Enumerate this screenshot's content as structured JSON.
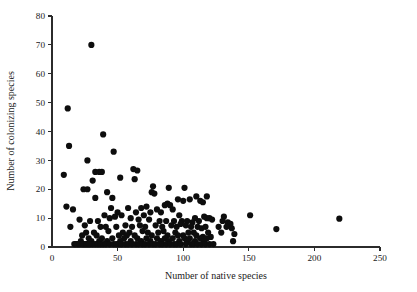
{
  "chart_data": {
    "type": "scatter",
    "title": "",
    "xlabel": "Number of native species",
    "ylabel": "Number of colonizing species",
    "xlim": [
      0,
      250
    ],
    "ylim": [
      0,
      80
    ],
    "xticks": [
      0,
      50,
      100,
      150,
      200,
      250
    ],
    "yticks": [
      0,
      10,
      20,
      30,
      40,
      50,
      60,
      70,
      80
    ],
    "xticklabels": [
      "0",
      "50",
      "100",
      "150",
      "200",
      "250"
    ],
    "yticklabels": [
      "0",
      "10",
      "20",
      "30",
      "40",
      "50",
      "60",
      "70",
      "80"
    ],
    "grid": false,
    "legend": null,
    "marker": "filled-circle",
    "marker_color": "#0d0d0d",
    "marker_size": 3.1,
    "n_points": 197,
    "points": [
      [
        30,
        70
      ],
      [
        12,
        48
      ],
      [
        39,
        39
      ],
      [
        13,
        35
      ],
      [
        47,
        33
      ],
      [
        27,
        30
      ],
      [
        62,
        27
      ],
      [
        65,
        26.5
      ],
      [
        33,
        26
      ],
      [
        36,
        26
      ],
      [
        38,
        26
      ],
      [
        9,
        25
      ],
      [
        52,
        24
      ],
      [
        63,
        23.5
      ],
      [
        31,
        23
      ],
      [
        77,
        21
      ],
      [
        24,
        20
      ],
      [
        27,
        20
      ],
      [
        89,
        20.5
      ],
      [
        101,
        20.5
      ],
      [
        76,
        19
      ],
      [
        42,
        19
      ],
      [
        78,
        18.5
      ],
      [
        46,
        17
      ],
      [
        33,
        17
      ],
      [
        110,
        17.5
      ],
      [
        118,
        17.5
      ],
      [
        105,
        16.5
      ],
      [
        96,
        16.5
      ],
      [
        113,
        16
      ],
      [
        100,
        16
      ],
      [
        115,
        15.5
      ],
      [
        88,
        15
      ],
      [
        86,
        14.5
      ],
      [
        90,
        14.5
      ],
      [
        11,
        14
      ],
      [
        16,
        13
      ],
      [
        45,
        13.5
      ],
      [
        58,
        13.5
      ],
      [
        68,
        13.5
      ],
      [
        72,
        14
      ],
      [
        80,
        13
      ],
      [
        92,
        13
      ],
      [
        50,
        12
      ],
      [
        64,
        12
      ],
      [
        75,
        12
      ],
      [
        83,
        12
      ],
      [
        40,
        11
      ],
      [
        53,
        11
      ],
      [
        70,
        11
      ],
      [
        97,
        11
      ],
      [
        151,
        11
      ],
      [
        131,
        10.5
      ],
      [
        116,
        10.5
      ],
      [
        118,
        10
      ],
      [
        120,
        10
      ],
      [
        122,
        9.5
      ],
      [
        109,
        10
      ],
      [
        219,
        9.8
      ],
      [
        21,
        9.5
      ],
      [
        29,
        9
      ],
      [
        35,
        9
      ],
      [
        44,
        10
      ],
      [
        48,
        10.5
      ],
      [
        60,
        10
      ],
      [
        66,
        9.5
      ],
      [
        74,
        9.5
      ],
      [
        82,
        9
      ],
      [
        87,
        9
      ],
      [
        93,
        9
      ],
      [
        99,
        9
      ],
      [
        103,
        9
      ],
      [
        107,
        8.5
      ],
      [
        112,
        9
      ],
      [
        130,
        9
      ],
      [
        134,
        8.5
      ],
      [
        136,
        8
      ],
      [
        171,
        6.2
      ],
      [
        14,
        7
      ],
      [
        25,
        7.5
      ],
      [
        37,
        7
      ],
      [
        41,
        7
      ],
      [
        49,
        7
      ],
      [
        56,
        7.5
      ],
      [
        61,
        7
      ],
      [
        67,
        7.5
      ],
      [
        71,
        7
      ],
      [
        79,
        7.5
      ],
      [
        84,
        7
      ],
      [
        91,
        7.5
      ],
      [
        95,
        7
      ],
      [
        98,
        8
      ],
      [
        102,
        7.5
      ],
      [
        106,
        7
      ],
      [
        111,
        7
      ],
      [
        114,
        6.5
      ],
      [
        117,
        7
      ],
      [
        127,
        7
      ],
      [
        133,
        7
      ],
      [
        137,
        6.5
      ],
      [
        139,
        4.5
      ],
      [
        26,
        5
      ],
      [
        32,
        5
      ],
      [
        43,
        5.5
      ],
      [
        54,
        5
      ],
      [
        59,
        5
      ],
      [
        69,
        5.5
      ],
      [
        73,
        5
      ],
      [
        81,
        5
      ],
      [
        85,
        5.5
      ],
      [
        94,
        5
      ],
      [
        104,
        5
      ],
      [
        108,
        5
      ],
      [
        119,
        5
      ],
      [
        129,
        5
      ],
      [
        23,
        4
      ],
      [
        34,
        4
      ],
      [
        51,
        4
      ],
      [
        57,
        4
      ],
      [
        63,
        4
      ],
      [
        76,
        4
      ],
      [
        88,
        4
      ],
      [
        96,
        4
      ],
      [
        100,
        4
      ],
      [
        110,
        4
      ],
      [
        115,
        3.5
      ],
      [
        121,
        3.5
      ],
      [
        28,
        3
      ],
      [
        38,
        3
      ],
      [
        46,
        3
      ],
      [
        55,
        3
      ],
      [
        65,
        3
      ],
      [
        72,
        3
      ],
      [
        80,
        3
      ],
      [
        86,
        3
      ],
      [
        92,
        3
      ],
      [
        101,
        3
      ],
      [
        105,
        3
      ],
      [
        113,
        3
      ],
      [
        118,
        3
      ],
      [
        138,
        2
      ],
      [
        22,
        2
      ],
      [
        30,
        2
      ],
      [
        36,
        2
      ],
      [
        42,
        2
      ],
      [
        52,
        2
      ],
      [
        60,
        2
      ],
      [
        68,
        2
      ],
      [
        75,
        2
      ],
      [
        83,
        2
      ],
      [
        89,
        2
      ],
      [
        97,
        2
      ],
      [
        103,
        2
      ],
      [
        109,
        2
      ],
      [
        116,
        2
      ],
      [
        17,
        1
      ],
      [
        19,
        1
      ],
      [
        20,
        1
      ],
      [
        24,
        1
      ],
      [
        25,
        1
      ],
      [
        27,
        1
      ],
      [
        29,
        1
      ],
      [
        31,
        1
      ],
      [
        33,
        1
      ],
      [
        35,
        1
      ],
      [
        37,
        1
      ],
      [
        39,
        1
      ],
      [
        41,
        1
      ],
      [
        44,
        1
      ],
      [
        47,
        1
      ],
      [
        49,
        1
      ],
      [
        51,
        1
      ],
      [
        53,
        1
      ],
      [
        56,
        1
      ],
      [
        58,
        1
      ],
      [
        61,
        1
      ],
      [
        64,
        1
      ],
      [
        66,
        1
      ],
      [
        69,
        1
      ],
      [
        71,
        1
      ],
      [
        74,
        1
      ],
      [
        77,
        1
      ],
      [
        79,
        1
      ],
      [
        82,
        1
      ],
      [
        84,
        1
      ],
      [
        87,
        1
      ],
      [
        90,
        1
      ],
      [
        93,
        1
      ],
      [
        95,
        1
      ],
      [
        98,
        1
      ],
      [
        102,
        1
      ],
      [
        106,
        1
      ],
      [
        108,
        1
      ],
      [
        111,
        1
      ],
      [
        114,
        1
      ],
      [
        117,
        1
      ],
      [
        120,
        1
      ],
      [
        123,
        1
      ],
      [
        18,
        1
      ],
      [
        21,
        1
      ],
      [
        23,
        1
      ],
      [
        26,
        1
      ],
      [
        28,
        1
      ]
    ]
  }
}
